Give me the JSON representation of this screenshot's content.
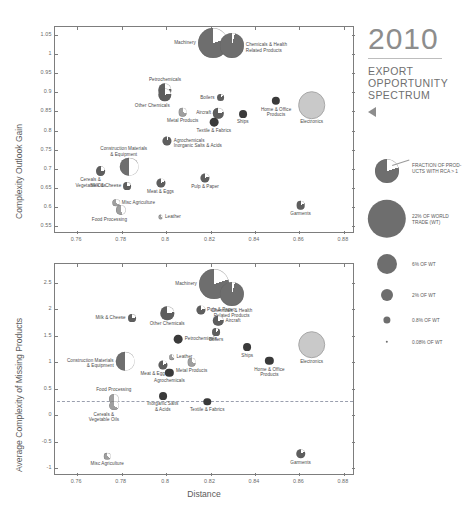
{
  "header": {
    "year": "2010",
    "line1": "EXPORT",
    "line2": "OPPORTUNITY",
    "line3": "SPECTRUM",
    "triangle_icon": "triangle-left-icon"
  },
  "legend": {
    "pie_caption": "FRACTION OF PROD-\nUCTS WITH RCA > 1",
    "sizes": [
      {
        "label": "22% OF WORLD\nTRADE (WT)",
        "value": 22
      },
      {
        "label": "6% OF WT",
        "value": 6
      },
      {
        "label": "2% OF WT",
        "value": 2
      },
      {
        "label": "0.8% OF WT",
        "value": 0.8
      },
      {
        "label": "0.08% OF WT",
        "value": 0.08
      }
    ]
  },
  "axis": {
    "xlabel": "Distance",
    "xticks": [
      "0.76",
      "0.78",
      "0.8",
      "0.82",
      "0.84",
      "0.86",
      "0.88"
    ],
    "top_ylabel": "Complexity Outlook Gain",
    "top_yticks": [
      "1.05",
      "1",
      "0.95",
      "0.9",
      "0.85",
      "0.8",
      "0.75",
      "0.7",
      "0.65",
      "0.6",
      "0.55"
    ],
    "bottom_ylabel": "Average Complexity of Missing Products",
    "bottom_yticks": [
      "2.5",
      "2",
      "1.5",
      "1",
      "0.5",
      "0",
      "-0.5",
      "-1"
    ]
  },
  "chart_data": [
    {
      "type": "scatter",
      "title": "Complexity Outlook Gain vs Distance",
      "xlabel": "Distance",
      "ylabel": "Complexity Outlook Gain",
      "xlim": [
        0.75,
        0.885
      ],
      "ylim": [
        0.53,
        1.07
      ],
      "grid": false,
      "legend_position": "right",
      "size_encoding": "share of world trade (%)",
      "color_encoding": "fraction of products with RCA > 1 (white wedge = share)",
      "points": [
        {
          "name": "Machinery",
          "x": 0.821,
          "y": 1.028,
          "wt": 13.0,
          "rca": 0.2,
          "label_pos": "left"
        },
        {
          "name": "Chemicals & Health\nRelated Products",
          "x": 0.8295,
          "y": 1.022,
          "wt": 8.5,
          "rca": 0.04,
          "label_pos": "right"
        },
        {
          "name": "Petrochemicals",
          "x": 0.7995,
          "y": 0.905,
          "wt": 2.6,
          "rca": 0.22,
          "label_pos": "top"
        },
        {
          "name": "Other Chemicals",
          "x": 0.7995,
          "y": 0.893,
          "wt": 2.6,
          "rca": 0.22,
          "label_pos": "bottom-left"
        },
        {
          "name": "Boilers",
          "x": 0.8245,
          "y": 0.886,
          "wt": 0.9,
          "rca": 0.12,
          "label_pos": "left"
        },
        {
          "name": "Home & Office\nProducts",
          "x": 0.8495,
          "y": 0.877,
          "wt": 1.0,
          "rca": 0.0,
          "label_pos": "bottom"
        },
        {
          "name": "Electronics",
          "x": 0.8655,
          "y": 0.866,
          "wt": 9.5,
          "rca": 0.98,
          "label_pos": "bottom"
        },
        {
          "name": "Metal Products",
          "x": 0.8075,
          "y": 0.848,
          "wt": 1.1,
          "rca": 0.3,
          "label_pos": "bottom"
        },
        {
          "name": "Aircraft",
          "x": 0.8235,
          "y": 0.845,
          "wt": 1.6,
          "rca": 0.22,
          "label_pos": "left"
        },
        {
          "name": "Ships",
          "x": 0.8345,
          "y": 0.843,
          "wt": 0.9,
          "rca": 0.0,
          "label_pos": "bottom"
        },
        {
          "name": "Textile & Fabrics",
          "x": 0.8215,
          "y": 0.822,
          "wt": 1.1,
          "rca": 0.0,
          "label_pos": "bottom"
        },
        {
          "name": "Agrochemicals\nInorganic Salts & Acids",
          "x": 0.8005,
          "y": 0.773,
          "wt": 1.2,
          "rca": 0.06,
          "label_pos": "right"
        },
        {
          "name": "Construction Materials\n& Equipment",
          "x": 0.7835,
          "y": 0.706,
          "wt": 5.0,
          "rca": 0.5,
          "label_pos": "top-left"
        },
        {
          "name": "Cereals &\nVegetable Oils",
          "x": 0.7705,
          "y": 0.695,
          "wt": 1.4,
          "rca": 0.22,
          "label_pos": "bottom-left"
        },
        {
          "name": "Pulp & Paper",
          "x": 0.8175,
          "y": 0.675,
          "wt": 1.2,
          "rca": 0.2,
          "label_pos": "bottom"
        },
        {
          "name": "Meat & Eggs",
          "x": 0.7975,
          "y": 0.664,
          "wt": 1.2,
          "rca": 0.18,
          "label_pos": "bottom"
        },
        {
          "name": "Milk & Cheese",
          "x": 0.7825,
          "y": 0.655,
          "wt": 0.9,
          "rca": 0.22,
          "label_pos": "left"
        },
        {
          "name": "Misc Agriculture",
          "x": 0.7775,
          "y": 0.612,
          "wt": 0.8,
          "rca": 0.35,
          "label_pos": "right"
        },
        {
          "name": "Garments",
          "x": 0.8605,
          "y": 0.606,
          "wt": 1.1,
          "rca": 0.18,
          "label_pos": "bottom"
        },
        {
          "name": "Food Processing",
          "x": 0.7795,
          "y": 0.592,
          "wt": 1.5,
          "rca": 0.45,
          "label_pos": "bottom-left"
        },
        {
          "name": "Leather",
          "x": 0.7975,
          "y": 0.575,
          "wt": 0.35,
          "rca": 0.3,
          "label_pos": "right"
        }
      ]
    },
    {
      "type": "scatter",
      "title": "Average Complexity of Missing Products vs Distance",
      "xlabel": "Distance",
      "ylabel": "Average Complexity of Missing Products",
      "xlim": [
        0.75,
        0.885
      ],
      "ylim": [
        -1.15,
        2.85
      ],
      "grid": false,
      "reference_line": 0.27,
      "legend_position": "right",
      "size_encoding": "share of world trade (%)",
      "color_encoding": "fraction of products with RCA > 1 (white wedge = share)",
      "points": [
        {
          "name": "Machinery",
          "x": 0.8215,
          "y": 2.48,
          "wt": 13.0,
          "rca": 0.2,
          "label_pos": "left"
        },
        {
          "name": "Chemicals & Health\nRelated Products",
          "x": 0.8295,
          "y": 2.28,
          "wt": 8.5,
          "rca": 0.04,
          "label_pos": "bottom"
        },
        {
          "name": "Other Chemicals",
          "x": 0.8005,
          "y": 1.92,
          "wt": 2.6,
          "rca": 0.22,
          "label_pos": "bottom"
        },
        {
          "name": "Pulp & Paper",
          "x": 0.8155,
          "y": 1.98,
          "wt": 1.2,
          "rca": 0.2,
          "label_pos": "right"
        },
        {
          "name": "Milk & Cheese",
          "x": 0.7845,
          "y": 1.83,
          "wt": 0.9,
          "rca": 0.22,
          "label_pos": "left"
        },
        {
          "name": "Aircraft",
          "x": 0.8235,
          "y": 1.78,
          "wt": 1.6,
          "rca": 0.22,
          "label_pos": "right"
        },
        {
          "name": "Boilers",
          "x": 0.8225,
          "y": 1.57,
          "wt": 0.9,
          "rca": 0.12,
          "label_pos": "bottom"
        },
        {
          "name": "Petrochemicals",
          "x": 0.8055,
          "y": 1.43,
          "wt": 1.1,
          "rca": 0.0,
          "label_pos": "right"
        },
        {
          "name": "Ships",
          "x": 0.8365,
          "y": 1.28,
          "wt": 0.9,
          "rca": 0.0,
          "label_pos": "bottom"
        },
        {
          "name": "Electronics",
          "x": 0.8655,
          "y": 1.33,
          "wt": 9.5,
          "rca": 0.98,
          "label_pos": "bottom"
        },
        {
          "name": "Leather",
          "x": 0.8025,
          "y": 1.09,
          "wt": 0.45,
          "rca": 0.3,
          "label_pos": "right"
        },
        {
          "name": "Construction Materials\n& Equipment",
          "x": 0.7815,
          "y": 1.02,
          "wt": 5.0,
          "rca": 0.5,
          "label_pos": "left"
        },
        {
          "name": "Metal Products",
          "x": 0.8115,
          "y": 1.0,
          "wt": 1.1,
          "rca": 0.3,
          "label_pos": "bottom"
        },
        {
          "name": "Meat & Eggs",
          "x": 0.7985,
          "y": 0.95,
          "wt": 1.2,
          "rca": 0.18,
          "label_pos": "bottom-left"
        },
        {
          "name": "Home & Office\nProducts",
          "x": 0.8465,
          "y": 1.02,
          "wt": 1.0,
          "rca": 0.0,
          "label_pos": "bottom"
        },
        {
          "name": "Agrochemicals",
          "x": 0.8015,
          "y": 0.8,
          "wt": 1.0,
          "rca": 0.0,
          "label_pos": "bottom"
        },
        {
          "name": "Food Processing",
          "x": 0.7765,
          "y": 0.3,
          "wt": 1.5,
          "rca": 0.45,
          "label_pos": "top"
        },
        {
          "name": "Cereals &\nVegetable Oils",
          "x": 0.7765,
          "y": 0.18,
          "wt": 1.4,
          "rca": 0.35,
          "label_pos": "bottom-left"
        },
        {
          "name": "Inorganic Salts\n& Acids",
          "x": 0.7985,
          "y": 0.36,
          "wt": 0.9,
          "rca": 0.0,
          "label_pos": "bottom"
        },
        {
          "name": "Textile & Fabrics",
          "x": 0.8185,
          "y": 0.25,
          "wt": 0.8,
          "rca": 0.0,
          "label_pos": "bottom"
        },
        {
          "name": "Misc Agriculture",
          "x": 0.7735,
          "y": -0.78,
          "wt": 0.6,
          "rca": 0.35,
          "label_pos": "bottom"
        },
        {
          "name": "Garments",
          "x": 0.8605,
          "y": -0.73,
          "wt": 1.3,
          "rca": 0.18,
          "label_pos": "bottom"
        }
      ]
    }
  ],
  "colors": {
    "dark": "#3a3a3a",
    "mid": "#6e6e6e",
    "light": "#c9c9c9",
    "wedge": "#ffffff",
    "axis": "#7d7d7d",
    "text": "#5a5a5a",
    "dash": "#9a9fae"
  }
}
